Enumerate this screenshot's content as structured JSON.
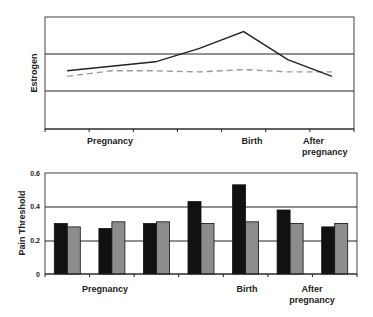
{
  "chart_data": [
    {
      "type": "line",
      "title": "",
      "xlabel": "",
      "ylabel": "Estrogen",
      "categories": [
        "1",
        "2",
        "3",
        "4",
        "5",
        "6",
        "7"
      ],
      "x_group_labels": [
        {
          "label": "Pregnancy",
          "at": 1
        },
        {
          "label": "Birth",
          "at": 4
        },
        {
          "label": "After pregnancy",
          "at": 5.5
        }
      ],
      "y_ticks_visible": false,
      "grid": true,
      "series": [
        {
          "name": "solid",
          "style": "solid",
          "color": "#222222",
          "values": [
            0.52,
            0.56,
            0.6,
            0.72,
            0.87,
            0.62,
            0.47
          ]
        },
        {
          "name": "dashed",
          "style": "dashed",
          "color": "#999999",
          "values": [
            0.47,
            0.52,
            0.52,
            0.51,
            0.53,
            0.51,
            0.51
          ]
        }
      ],
      "ylim": [
        0,
        1
      ]
    },
    {
      "type": "bar",
      "title": "",
      "xlabel": "",
      "ylabel": "Pain Threshold",
      "categories": [
        "1",
        "2",
        "3",
        "4",
        "5",
        "6",
        "7"
      ],
      "x_group_labels": [
        {
          "label": "Pregnancy",
          "at": 1
        },
        {
          "label": "Birth",
          "at": 4
        },
        {
          "label": "After pregnancy",
          "at": 5.5
        }
      ],
      "y_ticks": [
        "0",
        "0.2",
        "0.4",
        "0.6"
      ],
      "ylim": [
        0,
        0.6
      ],
      "grid": true,
      "series": [
        {
          "name": "black",
          "color": "#111111",
          "values": [
            0.3,
            0.27,
            0.3,
            0.43,
            0.53,
            0.38,
            0.28
          ]
        },
        {
          "name": "gray",
          "color": "#8c8c8c",
          "values": [
            0.28,
            0.31,
            0.31,
            0.3,
            0.31,
            0.3,
            0.3
          ]
        }
      ]
    }
  ],
  "labels": {
    "top_ylabel": "Estrogen",
    "bottom_ylabel": "Pain Threshold",
    "pregnancy": "Pregnancy",
    "birth": "Birth",
    "after1": "After",
    "after2": "pregnancy",
    "yt0": "0",
    "yt2": "0.2",
    "yt4": "0.4",
    "yt6": "0.6"
  }
}
